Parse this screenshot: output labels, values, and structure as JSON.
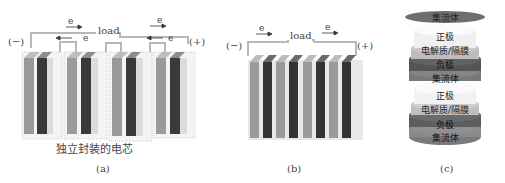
{
  "panel_a": {
    "caption": "(a)",
    "load_label": "load",
    "neg_terminal": "(−)",
    "pos_terminal": "(+)",
    "electron_labels": [
      "e",
      "e",
      "e",
      "e"
    ],
    "cell_label": "独立封装的电芯",
    "cell_count": 4
  },
  "panel_b": {
    "caption": "(b)",
    "load_label": "load",
    "neg_terminal": "(−)",
    "pos_terminal": "(+)",
    "electron_labels": [
      "e",
      "e"
    ],
    "plate_count": 8
  },
  "panel_c": {
    "caption": "(c)",
    "layers": [
      {
        "label": "集流体",
        "color": "#6e6e6e"
      },
      {
        "label": "正极",
        "color": "#f0f0f0"
      },
      {
        "label": "电解质/隔膜",
        "color": "#c8c8c8"
      },
      {
        "label": "负极",
        "color": "#5a5a5a"
      },
      {
        "label": "集流体",
        "color": "#7a7a7a"
      },
      {
        "label": "正极",
        "color": "#f0f0f0"
      },
      {
        "label": "电解质/隔膜",
        "color": "#c4c4c4"
      },
      {
        "label": "负极",
        "color": "#626262"
      },
      {
        "label": "集流体",
        "color": "#8a8a8a"
      }
    ]
  },
  "colors": {
    "plate_light": "#9a9a9a",
    "plate_dark": "#3a3a3a",
    "wire": "#b5b5b5",
    "casing": "#e6e6e6"
  }
}
